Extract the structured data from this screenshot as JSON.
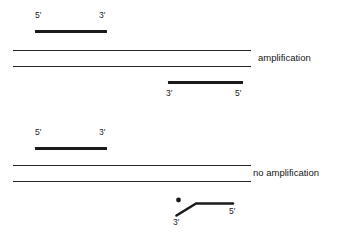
{
  "figure": {
    "background_color": "#ffffff",
    "line_color": "#1a1a1a",
    "template_color": "#262626",
    "width": 340,
    "height": 235
  },
  "panels": [
    {
      "id": "amplification",
      "outcome_label": "amplification",
      "forward_primer": {
        "left_label": "5′",
        "right_label": "3′"
      },
      "reverse_primer": {
        "left_label": "3′",
        "right_label": "5′",
        "matched": true
      },
      "template_strands": 2
    },
    {
      "id": "no-amplification",
      "outcome_label": "no amplification",
      "forward_primer": {
        "left_label": "5′",
        "right_label": "3′"
      },
      "reverse_primer": {
        "left_label": "3′",
        "right_label": "5′",
        "matched": false,
        "mismatch_marker": "mismatch-dot"
      },
      "template_strands": 2
    }
  ]
}
